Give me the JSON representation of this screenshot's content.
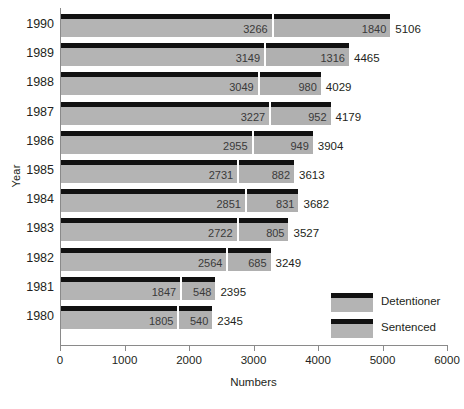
{
  "chart_data": {
    "type": "bar",
    "subtype": "horizontal-stacked",
    "title": "",
    "xlabel": "Numbers",
    "ylabel": "Year",
    "xlim": [
      0,
      6000
    ],
    "xticks": [
      0,
      1000,
      2000,
      3000,
      4000,
      5000,
      6000
    ],
    "xtick_labels": [
      "0",
      "1000",
      "2000",
      "3000",
      "4000",
      "5000",
      "6000"
    ],
    "grid": false,
    "legend_position": "bottom-right",
    "categories": [
      "1990",
      "1989",
      "1988",
      "1987",
      "1986",
      "1985",
      "1984",
      "1983",
      "1982",
      "1981",
      "1980"
    ],
    "series": [
      {
        "name": "Detentioner",
        "color": "#b4b4b4",
        "values": [
          3266,
          3149,
          3049,
          3227,
          2955,
          2731,
          2851,
          2722,
          2564,
          1847,
          1805
        ]
      },
      {
        "name": "Sentenced",
        "color": "#b0b0b0",
        "values": [
          1840,
          1316,
          980,
          952,
          949,
          882,
          831,
          805,
          685,
          548,
          540
        ]
      }
    ],
    "totals": [
      5106,
      4465,
      4029,
      4179,
      3904,
      3613,
      3682,
      3527,
      3249,
      2395,
      2345
    ],
    "rows": [
      {
        "year": "1990",
        "detentioner": 3266,
        "sentenced": 1840,
        "total": 5106
      },
      {
        "year": "1989",
        "detentioner": 3149,
        "sentenced": 1316,
        "total": 4465
      },
      {
        "year": "1988",
        "detentioner": 3049,
        "sentenced": 980,
        "total": 4029
      },
      {
        "year": "1987",
        "detentioner": 3227,
        "sentenced": 952,
        "total": 4179
      },
      {
        "year": "1986",
        "detentioner": 2955,
        "sentenced": 949,
        "total": 3904
      },
      {
        "year": "1985",
        "detentioner": 2731,
        "sentenced": 882,
        "total": 3613
      },
      {
        "year": "1984",
        "detentioner": 2851,
        "sentenced": 831,
        "total": 3682
      },
      {
        "year": "1983",
        "detentioner": 2722,
        "sentenced": 805,
        "total": 3527
      },
      {
        "year": "1982",
        "detentioner": 2564,
        "sentenced": 685,
        "total": 3249
      },
      {
        "year": "1981",
        "detentioner": 1847,
        "sentenced": 548,
        "total": 2395
      },
      {
        "year": "1980",
        "detentioner": 1805,
        "sentenced": 540,
        "total": 2345
      }
    ]
  },
  "legend": {
    "items": [
      {
        "label": "Detentioner"
      },
      {
        "label": "Sentenced"
      }
    ]
  },
  "axes": {
    "x_title": "Numbers",
    "y_title": "Year"
  },
  "colors": {
    "bar_body": "#b4b4b4",
    "bar_cap": "#111111",
    "axis": "#8a8a8a",
    "text": "#231f20",
    "value_text": "#3a3a3a",
    "background": "#ffffff"
  }
}
